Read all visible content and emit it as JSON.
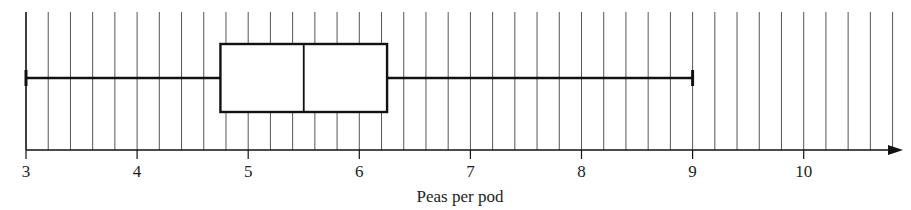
{
  "chart_data": {
    "type": "boxplot",
    "title": "",
    "xlabel": "Peas per pod",
    "ylabel": "",
    "xlim": [
      3,
      10.8
    ],
    "major_ticks": [
      3,
      4,
      5,
      6,
      7,
      8,
      9,
      10
    ],
    "minor_tick_step": 0.2,
    "grid": "vertical lines every 0.2",
    "box": {
      "min": 3,
      "q1": 4.75,
      "median": 5.5,
      "q3": 6.25,
      "max": 9
    },
    "colors": {
      "line": "#111111",
      "grid": "#555555",
      "background": "#ffffff"
    }
  }
}
